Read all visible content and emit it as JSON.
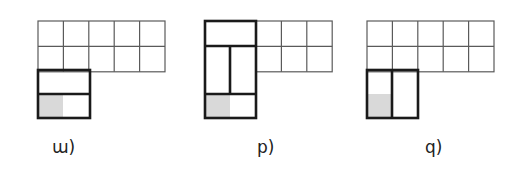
{
  "figures": [
    {
      "id": "figure-a",
      "label": "ɯ)",
      "grid": {
        "x": 38,
        "y": 21,
        "cols": 5,
        "rows": 2,
        "cell": 25.4
      },
      "thick_outline": {
        "x": 38,
        "y": 70,
        "w": 52,
        "h": 48
      },
      "thick_dividers": [
        {
          "x1": 38,
          "y1": 94,
          "x2": 90,
          "y2": 94
        }
      ],
      "shaded": {
        "x": 39,
        "y": 95,
        "w": 24,
        "h": 22
      },
      "label_pos": {
        "x": 52,
        "y": 139
      }
    },
    {
      "id": "figure-b",
      "label": "p)",
      "grid": {
        "x": 256,
        "y": 21,
        "cols": 3,
        "rows": 2,
        "cell": 25.4
      },
      "thick_outline": {
        "x": 205,
        "y": 21,
        "w": 51,
        "h": 97
      },
      "thick_dividers": [
        {
          "x1": 205,
          "y1": 46,
          "x2": 256,
          "y2": 46
        },
        {
          "x1": 205,
          "y1": 94,
          "x2": 256,
          "y2": 94
        },
        {
          "x1": 230,
          "y1": 46,
          "x2": 230,
          "y2": 94
        }
      ],
      "shaded": {
        "x": 206,
        "y": 95,
        "w": 24,
        "h": 22
      },
      "label_pos": {
        "x": 257,
        "y": 139
      }
    },
    {
      "id": "figure-c",
      "label": "q)",
      "grid": {
        "x": 367,
        "y": 21,
        "cols": 5,
        "rows": 2,
        "cell": 25.4
      },
      "thick_outline": {
        "x": 367,
        "y": 70,
        "w": 51,
        "h": 48
      },
      "thick_dividers": [
        {
          "x1": 392,
          "y1": 70,
          "x2": 392,
          "y2": 118
        }
      ],
      "shaded": {
        "x": 368,
        "y": 94,
        "w": 24,
        "h": 23
      },
      "label_pos": {
        "x": 425,
        "y": 139
      }
    }
  ],
  "colors": {
    "thin_line": "#5a5a5a",
    "thick_line": "#1a1a1a",
    "shade": "#d9d9d9"
  }
}
